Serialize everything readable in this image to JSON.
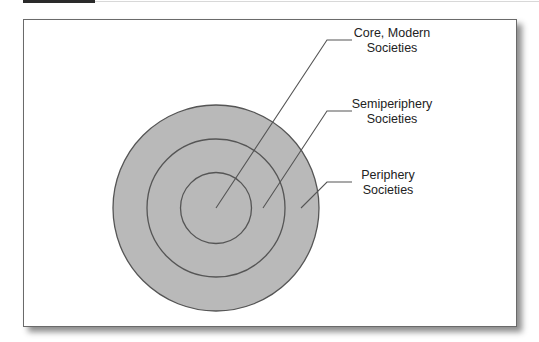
{
  "diagram": {
    "type": "concentric-circles",
    "labels": {
      "core": [
        "Core, Modern",
        "Societies"
      ],
      "semiperiphery": [
        "Semiperiphery",
        "Societies"
      ],
      "periphery": [
        "Periphery",
        "Societies"
      ]
    },
    "colors": {
      "fill": "#b9b9b9",
      "stroke": "#555555",
      "frame": "#6a6a6a"
    }
  }
}
